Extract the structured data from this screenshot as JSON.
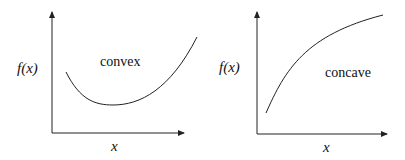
{
  "diagrams": [
    {
      "name": "convex",
      "label": "convex",
      "ylabel": "f(x)",
      "xlabel": "x"
    },
    {
      "name": "concave",
      "label": "concave",
      "ylabel": "f(x)",
      "xlabel": "x"
    }
  ],
  "colors": {
    "stroke": "#222222",
    "background": "#ffffff"
  }
}
